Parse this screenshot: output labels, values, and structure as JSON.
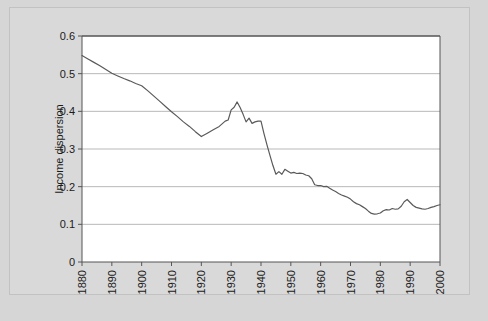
{
  "figure": {
    "background_color": "#d6d6d6",
    "panel_color": "#d9d9d9",
    "plot_background_color": "#ffffff",
    "line_color": "#5a5a5a",
    "grid_color": "#b0b0b0",
    "axis_color": "#555555",
    "caption_fragment": ""
  },
  "chart_data": {
    "type": "line",
    "title": "",
    "xlabel": "",
    "ylabel": "Income dispersion",
    "xlim": [
      1880,
      2000
    ],
    "ylim": [
      0,
      0.6
    ],
    "grid": true,
    "grid_axis": "y",
    "legend": false,
    "legend_position": "none",
    "y_ticks": [
      0,
      0.1,
      0.2,
      0.3,
      0.4,
      0.5,
      0.6
    ],
    "y_tick_labels": [
      "0",
      "0.1",
      "0.2",
      "0.3",
      "0.4",
      "0.5",
      "0.6"
    ],
    "x_ticks": [
      1880,
      1890,
      1900,
      1910,
      1920,
      1930,
      1940,
      1950,
      1960,
      1970,
      1980,
      1990,
      2000
    ],
    "x_tick_labels": [
      "1880",
      "1890",
      "1900",
      "1910",
      "1920",
      "1930",
      "1940",
      "1950",
      "1960",
      "1970",
      "1980",
      "1990",
      "2000"
    ],
    "x_tick_label_rotation": 90,
    "series": [
      {
        "name": "Income dispersion",
        "x": [
          1880,
          1882,
          1884,
          1886,
          1888,
          1890,
          1892,
          1894,
          1896,
          1898,
          1900,
          1902,
          1904,
          1906,
          1908,
          1910,
          1912,
          1914,
          1916,
          1918,
          1920,
          1922,
          1924,
          1926,
          1928,
          1929,
          1930,
          1931,
          1932,
          1933,
          1934,
          1935,
          1936,
          1937,
          1938,
          1939,
          1940,
          1941,
          1942,
          1943,
          1944,
          1945,
          1946,
          1947,
          1948,
          1949,
          1950,
          1951,
          1952,
          1953,
          1954,
          1955,
          1956,
          1957,
          1958,
          1959,
          1960,
          1961,
          1962,
          1963,
          1964,
          1965,
          1966,
          1967,
          1968,
          1969,
          1970,
          1971,
          1972,
          1973,
          1974,
          1975,
          1976,
          1977,
          1978,
          1979,
          1980,
          1981,
          1982,
          1983,
          1984,
          1985,
          1986,
          1987,
          1988,
          1989,
          1990,
          1991,
          1992,
          1993,
          1994,
          1995,
          1996,
          1997,
          1998,
          1999,
          2000
        ],
        "y": [
          0.548,
          0.539,
          0.53,
          0.521,
          0.511,
          0.501,
          0.494,
          0.487,
          0.481,
          0.474,
          0.468,
          0.455,
          0.441,
          0.427,
          0.413,
          0.399,
          0.386,
          0.372,
          0.36,
          0.346,
          0.333,
          0.342,
          0.351,
          0.36,
          0.374,
          0.377,
          0.404,
          0.411,
          0.425,
          0.41,
          0.392,
          0.372,
          0.382,
          0.368,
          0.372,
          0.374,
          0.374,
          0.341,
          0.311,
          0.283,
          0.256,
          0.233,
          0.24,
          0.233,
          0.246,
          0.241,
          0.236,
          0.238,
          0.235,
          0.236,
          0.235,
          0.231,
          0.229,
          0.221,
          0.205,
          0.203,
          0.203,
          0.2,
          0.201,
          0.196,
          0.191,
          0.187,
          0.182,
          0.178,
          0.175,
          0.172,
          0.167,
          0.16,
          0.155,
          0.152,
          0.147,
          0.142,
          0.135,
          0.129,
          0.127,
          0.128,
          0.13,
          0.136,
          0.139,
          0.138,
          0.142,
          0.14,
          0.141,
          0.148,
          0.16,
          0.166,
          0.158,
          0.15,
          0.145,
          0.143,
          0.141,
          0.14,
          0.142,
          0.145,
          0.147,
          0.15,
          0.152
        ]
      }
    ]
  }
}
